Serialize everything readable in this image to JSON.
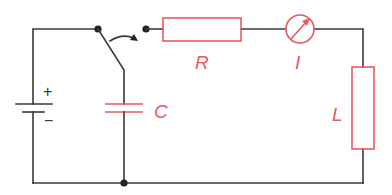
{
  "diagram": {
    "title": "",
    "type": "electrical-circuit",
    "colors": {
      "wire": "#3a3a3a",
      "component": "#e85a62",
      "inductor_fill": "#f9d6d8"
    },
    "components": [
      {
        "id": "battery",
        "kind": "dc-source",
        "plus_label": "+",
        "minus_label": "−"
      },
      {
        "id": "switch",
        "kind": "two-way-switch"
      },
      {
        "id": "capacitor",
        "kind": "capacitor",
        "label": "C"
      },
      {
        "id": "resistor",
        "kind": "resistor",
        "label": "R"
      },
      {
        "id": "ammeter",
        "kind": "ammeter",
        "label": "I"
      },
      {
        "id": "inductor",
        "kind": "inductor",
        "label": "L"
      }
    ],
    "labels": {
      "plus": "+",
      "minus": "−",
      "capacitor": "C",
      "resistor": "R",
      "ammeter": "I",
      "inductor": "L"
    }
  }
}
